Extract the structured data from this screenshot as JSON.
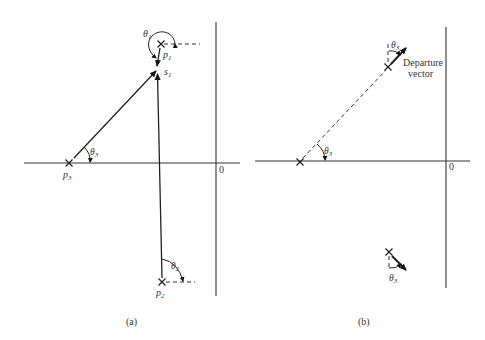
{
  "figure": {
    "panel_a": {
      "caption": "(a)",
      "origin_label": "0",
      "poles": [
        {
          "id": "p1",
          "label": "p",
          "sub": "1"
        },
        {
          "id": "p2",
          "label": "p",
          "sub": "2"
        },
        {
          "id": "p3",
          "label": "p",
          "sub": "3"
        }
      ],
      "test_point": {
        "label": "s",
        "sub": "1"
      },
      "angles": [
        {
          "label": "θ",
          "sub": "1"
        },
        {
          "label": "θ",
          "sub": "2"
        },
        {
          "label": "θ",
          "sub": "3"
        }
      ]
    },
    "panel_b": {
      "caption": "(b)",
      "origin_label": "0",
      "departure_label_line1": "Departure",
      "departure_label_line2": "vector",
      "angles": [
        {
          "label": "θ",
          "sub": "3"
        },
        {
          "label": "θ",
          "sub": "3"
        },
        {
          "label": "θ",
          "sub": "3"
        }
      ]
    }
  }
}
